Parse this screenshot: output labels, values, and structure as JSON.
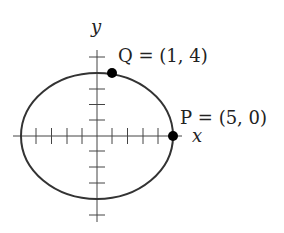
{
  "diagram": {
    "axes": {
      "x_label": "x",
      "y_label": "y",
      "x_ticks": [
        -5,
        -4,
        -3,
        -2,
        -1,
        1,
        2,
        3,
        4,
        5
      ],
      "y_ticks": [
        -5,
        -4,
        -3,
        -2,
        -1,
        1,
        2,
        3,
        4,
        5
      ]
    },
    "curve": {
      "type": "ellipse",
      "center": [
        0,
        0
      ],
      "semi_axis_x": 5,
      "semi_axis_y": 4
    },
    "points": [
      {
        "name": "Q",
        "coords": "(1, 4)",
        "label": "Q = (1, 4)"
      },
      {
        "name": "P",
        "coords": "(5, 0)",
        "label": "P = (5, 0)"
      }
    ],
    "colors": {
      "stroke": "#333333",
      "point": "#000000",
      "background": "#ffffff"
    }
  }
}
